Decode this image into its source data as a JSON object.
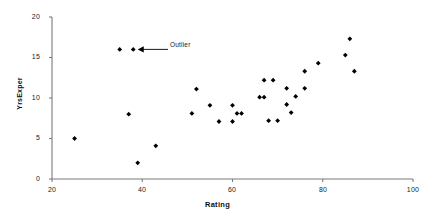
{
  "chart_data": {
    "type": "scatter",
    "title": "",
    "xlabel": "Rating",
    "ylabel": "YrsExper",
    "xlim": [
      20,
      100
    ],
    "ylim": [
      0,
      20
    ],
    "xticks": [
      20,
      40,
      60,
      80,
      100
    ],
    "yticks": [
      0,
      5,
      10,
      15,
      20
    ],
    "grid": false,
    "legend": null,
    "marker": "diamond",
    "marker_color": "#000000",
    "series": [
      {
        "name": "Employees",
        "points": [
          [
            25,
            5.0
          ],
          [
            35,
            16.0
          ],
          [
            38,
            16.0
          ],
          [
            37,
            8.0
          ],
          [
            39,
            2.0
          ],
          [
            43,
            4.1
          ],
          [
            51,
            8.1
          ],
          [
            52,
            11.1
          ],
          [
            55,
            9.1
          ],
          [
            57,
            7.1
          ],
          [
            60,
            9.1
          ],
          [
            60,
            7.1
          ],
          [
            61,
            8.1
          ],
          [
            62,
            8.1
          ],
          [
            66,
            10.1
          ],
          [
            67,
            10.1
          ],
          [
            67,
            12.2
          ],
          [
            68,
            7.2
          ],
          [
            69,
            12.2
          ],
          [
            70,
            7.2
          ],
          [
            72,
            9.2
          ],
          [
            72,
            11.2
          ],
          [
            73,
            8.2
          ],
          [
            74,
            10.2
          ],
          [
            76,
            11.2
          ],
          [
            76,
            13.3
          ],
          [
            79,
            14.3
          ],
          [
            85,
            15.3
          ],
          [
            86,
            17.3
          ],
          [
            87,
            13.3
          ]
        ]
      }
    ],
    "annotations": [
      {
        "text": "Outlier",
        "target_point": [
          38,
          16.0
        ],
        "arrow": "left"
      }
    ],
    "axis_color": "#7a7a7a"
  },
  "axis": {
    "x_title": "Rating",
    "y_title": "YrsExper",
    "x_tick_labels": [
      "20",
      "40",
      "60",
      "80",
      "100"
    ],
    "y_tick_labels": [
      "0",
      "5",
      "10",
      "15",
      "20"
    ]
  },
  "annotation": {
    "outlier_label": "Outlier"
  }
}
